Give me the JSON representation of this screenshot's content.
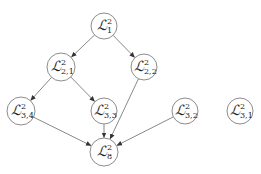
{
  "diagram": {
    "type": "directed-graph",
    "colors": {
      "node_stroke": "#6e6e6e",
      "edge": "#555555",
      "background": "#ffffff"
    },
    "nodes": [
      {
        "id": "L1",
        "base": "ℒ",
        "sup": "2",
        "sub": "1",
        "x": 104,
        "y": 26,
        "r": 13
      },
      {
        "id": "L21",
        "base": "ℒ",
        "sup": "2",
        "sub": "2,1",
        "x": 61,
        "y": 67,
        "r": 14
      },
      {
        "id": "L22",
        "base": "ℒ",
        "sup": "2",
        "sub": "2,2",
        "x": 144,
        "y": 67,
        "r": 13
      },
      {
        "id": "L34",
        "base": "ℒ",
        "sup": "2",
        "sub": "3,4",
        "x": 21,
        "y": 111,
        "r": 14
      },
      {
        "id": "L33",
        "base": "ℒ",
        "sup": "2",
        "sub": "3,3",
        "x": 104,
        "y": 111,
        "r": 13
      },
      {
        "id": "L32",
        "base": "ℒ",
        "sup": "2",
        "sub": "3,2",
        "x": 185,
        "y": 111,
        "r": 13
      },
      {
        "id": "L31",
        "base": "ℒ",
        "sup": "2",
        "sub": "3,1",
        "x": 240,
        "y": 111,
        "r": 13
      },
      {
        "id": "L8",
        "base": "ℒ",
        "sup": "2",
        "sub": "8",
        "x": 104,
        "y": 152,
        "r": 14
      }
    ],
    "edges": [
      {
        "from": "L1",
        "to": "L21"
      },
      {
        "from": "L1",
        "to": "L22"
      },
      {
        "from": "L21",
        "to": "L34"
      },
      {
        "from": "L21",
        "to": "L33"
      },
      {
        "from": "L34",
        "to": "L8"
      },
      {
        "from": "L33",
        "to": "L8"
      },
      {
        "from": "L22",
        "to": "L8"
      },
      {
        "from": "L32",
        "to": "L8"
      }
    ]
  }
}
